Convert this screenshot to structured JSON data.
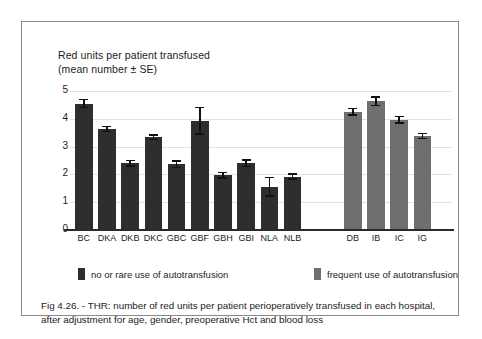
{
  "figure": {
    "axis_title_line1": "Red units per patient  transfused",
    "axis_title_line2": "(mean number ± SE)",
    "caption": "Fig 4.26. - THR: number of red units per patient perioperatively transfused in each hospital, after adjustment for age, gender, preoperative Hct and blood loss"
  },
  "legend": {
    "items": [
      {
        "label": "no or rare use of autotransfusion",
        "color": "#2e2e2e",
        "swatch": "dark-square-swatch"
      },
      {
        "label": "frequent use of autotransfusion",
        "color": "#6f6f6f",
        "swatch": "gray-square-swatch"
      }
    ]
  },
  "chart_data": {
    "type": "bar",
    "xlabel": "",
    "ylabel": "Red units per patient transfused",
    "ylim": [
      0,
      5
    ],
    "yticks": [
      0,
      1,
      2,
      3,
      4,
      5
    ],
    "ytick_labels": [
      "0",
      "1",
      "2",
      "3",
      "4",
      "5"
    ],
    "grid": true,
    "legend_position": "below-axes",
    "categories": [
      "BC",
      "DKA",
      "DKB",
      "DKC",
      "GBC",
      "GBF",
      "GBH",
      "GBI",
      "NLA",
      "NLB",
      "DB",
      "IB",
      "IC",
      "IG"
    ],
    "values": [
      4.55,
      3.63,
      2.4,
      3.33,
      2.37,
      3.93,
      1.97,
      2.4,
      1.55,
      1.92,
      4.25,
      4.63,
      3.97,
      3.38
    ],
    "errors": [
      0.17,
      0.12,
      0.13,
      0.11,
      0.15,
      0.5,
      0.13,
      0.14,
      0.36,
      0.12,
      0.15,
      0.18,
      0.14,
      0.12
    ],
    "groups": [
      "no or rare use of autotransfusion",
      "no or rare use of autotransfusion",
      "no or rare use of autotransfusion",
      "no or rare use of autotransfusion",
      "no or rare use of autotransfusion",
      "no or rare use of autotransfusion",
      "no or rare use of autotransfusion",
      "no or rare use of autotransfusion",
      "no or rare use of autotransfusion",
      "no or rare use of autotransfusion",
      "frequent use of autotransfusion",
      "frequent use of autotransfusion",
      "frequent use of autotransfusion",
      "frequent use of autotransfusion"
    ],
    "colors": [
      "#2e2e2e",
      "#2e2e2e",
      "#2e2e2e",
      "#2e2e2e",
      "#2e2e2e",
      "#2e2e2e",
      "#2e2e2e",
      "#2e2e2e",
      "#2e2e2e",
      "#2e2e2e",
      "#6f6f6f",
      "#6f6f6f",
      "#6f6f6f",
      "#6f6f6f"
    ]
  }
}
